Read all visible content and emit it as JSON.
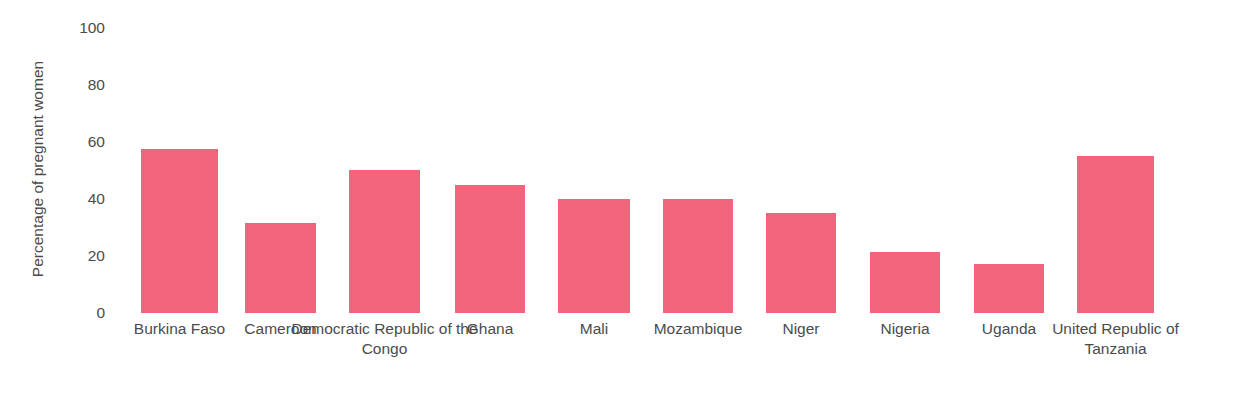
{
  "chart_title": "…y of malaria in pregnancy: intermittent preventive treatment in pregnancy (IPTp)",
  "colors": {
    "bar": "#f2647c",
    "text": "#4b4b4b",
    "background": "#ffffff"
  },
  "chart_data": {
    "type": "bar",
    "title": "",
    "xlabel": "",
    "ylabel": "Percentage of pregnant women",
    "ylim": [
      0,
      100
    ],
    "yticks": [
      "0",
      "20",
      "40",
      "60",
      "80",
      "100"
    ],
    "grid": false,
    "legend": "none",
    "categories": [
      "Burkina Faso",
      "Cameroon",
      "Democratic Republic of the Congo",
      "Ghana",
      "Mali",
      "Mozambique",
      "Niger",
      "Nigeria",
      "Uganda",
      "United Republic of Tanzania"
    ],
    "values": [
      57.5,
      31.5,
      50,
      45,
      40,
      40,
      35,
      21.5,
      17,
      55
    ]
  }
}
